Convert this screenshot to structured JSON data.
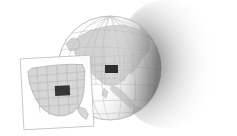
{
  "illustration": {
    "title": "Globe with United States inset map",
    "description": "Grayscale illustration of a three-dimensional globe showing North America with latitude and longitude graticule lines, casting a soft shadow to the right. A tilted rectangular inset panel in front shows a map of the western and central United States with state boundaries and one state filled dark, matching a dark marker rectangle on the globe.",
    "background_color": "#ffffff"
  },
  "globe": {
    "name": "Earth globe",
    "center_x": 110,
    "center_y": 68,
    "radius": 52,
    "outline_color": "#b9b9b9",
    "ocean_color": "#ffffff",
    "land_color": "#d2d2d2",
    "land_outline_color": "#a8a8a8",
    "graticule_color": "#bdbdbd",
    "terminator_shade_color": "#9a9a9a",
    "visible_continent": "North America",
    "meridian_count": 7,
    "parallel_count": 6,
    "marker": {
      "name": "highlighted region marker",
      "color": "#2e2e2e",
      "x": 105,
      "y": 65,
      "width": 13,
      "height": 8
    }
  },
  "shadow": {
    "name": "cast shadow",
    "color": "#4a4a4a",
    "opacity": 0.55,
    "direction": "right",
    "center_x": 166,
    "center_y": 64,
    "radius_x": 52,
    "radius_y": 64
  },
  "inset": {
    "name": "United States inset map panel",
    "frame_color": "#bcbcbc",
    "fill_color": "#ffffff",
    "rotation_degrees": -3,
    "x": 22,
    "y": 57,
    "width": 70,
    "height": 71,
    "map": {
      "name": "western and central United States",
      "land_color": "#d6d6d6",
      "border_color": "#a2a2a2",
      "state_line_color": "#b0b0b0",
      "highlighted_state_color": "#363636",
      "highlighted_state": {
        "x": 33,
        "y": 29,
        "width": 15,
        "height": 10
      }
    }
  }
}
